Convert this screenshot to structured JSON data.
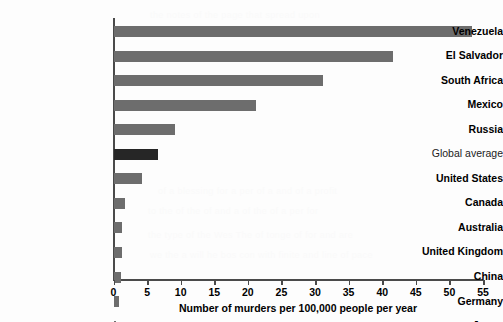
{
  "chart_data": {
    "type": "bar",
    "orientation": "horizontal",
    "title": "",
    "xlabel": "Number of murders per 100,000 people per year",
    "ylabel": "",
    "xlim": [
      0,
      55
    ],
    "xticks": [
      0,
      5,
      10,
      15,
      20,
      25,
      30,
      35,
      40,
      45,
      50,
      55
    ],
    "grid": false,
    "legend": null,
    "categories": [
      "Venezuela",
      "El Salvador",
      "South Africa",
      "Mexico",
      "Russia",
      "Global average",
      "United States",
      "Canada",
      "Australia",
      "United Kingdom",
      "China",
      "Germany",
      "Japan"
    ],
    "values": [
      53.4,
      41.6,
      31.2,
      21.2,
      9.1,
      6.6,
      4.2,
      1.7,
      1.3,
      1.2,
      1.1,
      0.8,
      0.3
    ],
    "bar_colors": [
      "#6d6d6d",
      "#6d6d6d",
      "#6d6d6d",
      "#6d6d6d",
      "#6d6d6d",
      "#262626",
      "#6d6d6d",
      "#6d6d6d",
      "#6d6d6d",
      "#6d6d6d",
      "#6d6d6d",
      "#6d6d6d",
      "#6d6d6d"
    ],
    "highlight_category": "Global average",
    "colors": {
      "bar": "#6d6d6d",
      "highlight_bar": "#262626",
      "axis": "#4a4a4a",
      "text": "#000000",
      "background": "#fdfdfd"
    }
  },
  "bleed_text": {
    "lines": [
      "the notes of the page that spread upon",
      "of interpret a for the of the of the",
      "of a blessing for a per of a and of a profit",
      "to the of the of and a of the of a per for",
      "the type of the Wes The of tonge of for and are",
      "we the a will he bos con with finite and line of pace"
    ]
  }
}
